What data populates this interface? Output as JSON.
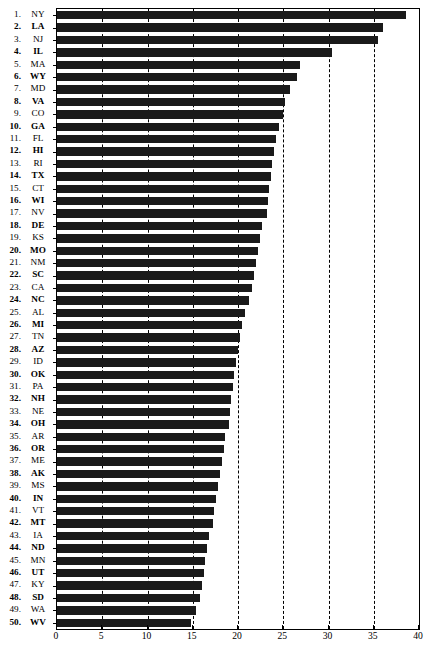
{
  "chart_data": {
    "type": "bar",
    "orientation": "horizontal",
    "title": "",
    "subtitle": "",
    "xlabel": "",
    "ylabel": "",
    "xlim": [
      0,
      40
    ],
    "ylim": null,
    "grid": true,
    "grid_style": "dashed vertical",
    "legend": null,
    "legend_position": "none",
    "bar_color": "#1a1a1a",
    "x_ticks": [
      0,
      5,
      10,
      15,
      20,
      25,
      30,
      35,
      40
    ],
    "x_tick_labels": [
      "0",
      "5",
      "10",
      "15",
      "20",
      "25",
      "30",
      "35",
      "40"
    ],
    "categories": [
      "NY",
      "LA",
      "NJ",
      "IL",
      "MA",
      "WY",
      "MD",
      "VA",
      "CO",
      "GA",
      "FL",
      "HI",
      "RI",
      "TX",
      "CT",
      "WI",
      "NV",
      "DE",
      "KS",
      "MO",
      "NM",
      "SC",
      "CA",
      "NC",
      "AL",
      "MI",
      "TN",
      "AZ",
      "ID",
      "OK",
      "PA",
      "NH",
      "NE",
      "OH",
      "AR",
      "OR",
      "ME",
      "AK",
      "MS",
      "IN",
      "VT",
      "MT",
      "IA",
      "ND",
      "MN",
      "UT",
      "KY",
      "SD",
      "WA",
      "WV"
    ],
    "ranks": [
      "1.",
      "2.",
      "3.",
      "4.",
      "5.",
      "6.",
      "7.",
      "8.",
      "9.",
      "10.",
      "11.",
      "12.",
      "13.",
      "14.",
      "15.",
      "16.",
      "17.",
      "18.",
      "19.",
      "20.",
      "21.",
      "22.",
      "23.",
      "24.",
      "25.",
      "26.",
      "27.",
      "28.",
      "29.",
      "30.",
      "31.",
      "32.",
      "33.",
      "34.",
      "35.",
      "36.",
      "37.",
      "38.",
      "39.",
      "40.",
      "41.",
      "42.",
      "43.",
      "44.",
      "45.",
      "46.",
      "47.",
      "48.",
      "49.",
      "50."
    ],
    "values": [
      38.6,
      36.0,
      35.5,
      30.4,
      26.8,
      26.5,
      25.7,
      25.2,
      25.0,
      24.5,
      24.2,
      24.0,
      23.8,
      23.6,
      23.4,
      23.3,
      23.2,
      22.7,
      22.4,
      22.2,
      22.0,
      21.8,
      21.5,
      21.2,
      20.8,
      20.4,
      20.2,
      20.0,
      19.8,
      19.6,
      19.4,
      19.2,
      19.1,
      19.0,
      18.6,
      18.4,
      18.2,
      18.0,
      17.8,
      17.6,
      17.4,
      17.2,
      16.8,
      16.6,
      16.4,
      16.2,
      16.0,
      15.8,
      15.4,
      14.8
    ],
    "bold_rows": [
      "2.",
      "4.",
      "6.",
      "8.",
      "10.",
      "12.",
      "14.",
      "16.",
      "18.",
      "20.",
      "22.",
      "24.",
      "26.",
      "28.",
      "30.",
      "32.",
      "34.",
      "36.",
      "38.",
      "40.",
      "42.",
      "44.",
      "46.",
      "48.",
      "50."
    ]
  }
}
